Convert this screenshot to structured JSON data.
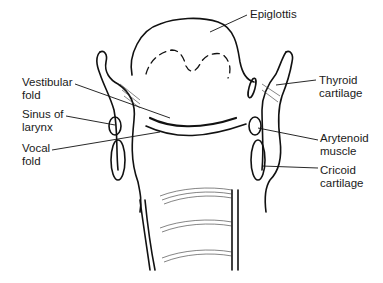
{
  "diagram": {
    "labels": {
      "epiglottis": {
        "lines": [
          "Epiglottis"
        ]
      },
      "vestibular_fold": {
        "lines": [
          "Vestibular",
          "fold"
        ]
      },
      "sinus_of_larynx": {
        "lines": [
          "Sinus of",
          "larynx"
        ]
      },
      "vocal_fold": {
        "lines": [
          "Vocal",
          "fold"
        ]
      },
      "thyroid_cartilage": {
        "lines": [
          "Thyroid",
          "cartilage"
        ]
      },
      "arytenoid_muscle": {
        "lines": [
          "Arytenoid",
          "muscle"
        ]
      },
      "cricoid_cartilage": {
        "lines": [
          "Cricoid",
          "cartilage"
        ]
      }
    },
    "colors": {
      "line": "#111111",
      "background": "#ffffff",
      "text": "#1a1a1a"
    }
  }
}
